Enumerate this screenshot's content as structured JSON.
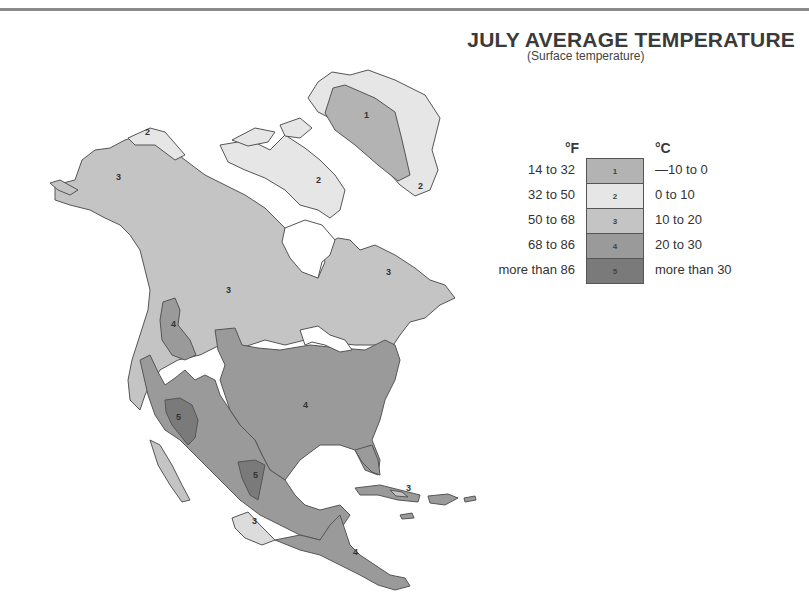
{
  "header": {
    "title": "JULY AVERAGE TEMPERATURE",
    "subtitle": "(Surface temperature)"
  },
  "legend": {
    "fahrenheit_header": "°F",
    "celsius_header": "°C",
    "items": [
      {
        "zone": "1",
        "fahrenheit": "14 to 32",
        "celsius": "—10 to 0",
        "color": "#b3b3b3"
      },
      {
        "zone": "2",
        "fahrenheit": "32 to 50",
        "celsius": "0 to 10",
        "color": "#e6e6e6"
      },
      {
        "zone": "3",
        "fahrenheit": "50 to 68",
        "celsius": "10 to 20",
        "color": "#c4c4c4"
      },
      {
        "zone": "4",
        "fahrenheit": "68 to 86",
        "celsius": "20 to 30",
        "color": "#9a9a9a"
      },
      {
        "zone": "5",
        "fahrenheit": "more than 86",
        "celsius": "more than 30",
        "color": "#7a7a7a"
      }
    ]
  },
  "map": {
    "region": "North America",
    "zone_labels": [
      {
        "text": "1",
        "region": "Greenland interior"
      },
      {
        "text": "2",
        "region": "Greenland coast"
      },
      {
        "text": "2",
        "region": "Northern Alaska coast"
      },
      {
        "text": "2",
        "region": "Arctic archipelago"
      },
      {
        "text": "3",
        "region": "Alaska"
      },
      {
        "text": "3",
        "region": "Western Canada"
      },
      {
        "text": "3",
        "region": "Quebec / Labrador"
      },
      {
        "text": "4",
        "region": "Columbia Plateau"
      },
      {
        "text": "4",
        "region": "Eastern United States"
      },
      {
        "text": "5",
        "region": "Southwest desert"
      },
      {
        "text": "5",
        "region": "Northern Mexico / Texas"
      },
      {
        "text": "3",
        "region": "Mexican plateau"
      },
      {
        "text": "3",
        "region": "Cuba"
      },
      {
        "text": "4",
        "region": "Central America"
      }
    ]
  }
}
